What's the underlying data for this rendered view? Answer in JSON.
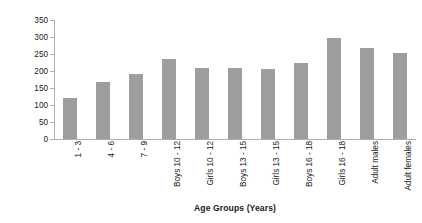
{
  "chart_data": {
    "type": "bar",
    "title": "",
    "xlabel": "Age Groups (Years)",
    "ylabel": "Vitamin A Intake (µg)",
    "ylim": [
      0,
      350
    ],
    "ytick_step": 50,
    "yticks": [
      0,
      50,
      100,
      150,
      200,
      250,
      300,
      350
    ],
    "grid": false,
    "legend": false,
    "bar_color": "#9e9e9e",
    "axis_color": "#b0b0b0",
    "text_color": "#1a1a1a",
    "categories": [
      "1 - 3",
      "4 - 6",
      "7 - 9",
      "Boys 10 - 12",
      "Girls 10 - 12",
      "Boys 13 - 15",
      "Girls 13 - 15",
      "Boys 16 - 18",
      "Girls 16 - 18",
      "Adult males",
      "Adult females"
    ],
    "values": [
      120,
      168,
      192,
      234,
      210,
      208,
      207,
      224,
      297,
      267,
      252
    ]
  }
}
